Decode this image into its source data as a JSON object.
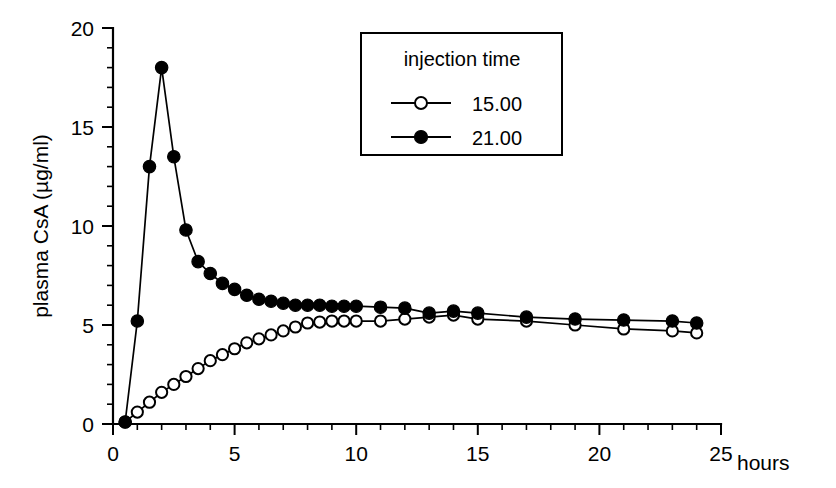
{
  "chart_data": {
    "type": "line",
    "title": "",
    "xlabel": "hours",
    "ylabel": "plasma CsA (µg/ml)",
    "xlim": [
      0,
      26.5
    ],
    "ylim": [
      0,
      20
    ],
    "x_ticks": [
      0,
      5,
      10,
      15,
      20,
      25
    ],
    "y_ticks": [
      0,
      5,
      10,
      15,
      20
    ],
    "x_minor_step": 1,
    "y_minor_step": 1,
    "grid": false,
    "legend_position": "top-right",
    "legend_title": "injection time",
    "series": [
      {
        "name": "15.00",
        "marker": "open-circle",
        "x": [
          0.5,
          1.0,
          1.5,
          2.0,
          2.5,
          3.0,
          3.5,
          4.0,
          4.5,
          5.0,
          5.5,
          6.0,
          6.5,
          7.0,
          7.5,
          8.0,
          8.5,
          9.0,
          9.5,
          10.0,
          11.0,
          12.0,
          13.0,
          14.0,
          15.0,
          17.0,
          19.0,
          21.0,
          23.0,
          24.0
        ],
        "y": [
          0.1,
          0.6,
          1.1,
          1.6,
          2.0,
          2.4,
          2.8,
          3.2,
          3.5,
          3.8,
          4.1,
          4.3,
          4.5,
          4.7,
          4.9,
          5.1,
          5.15,
          5.2,
          5.2,
          5.2,
          5.2,
          5.3,
          5.4,
          5.5,
          5.3,
          5.2,
          5.0,
          4.8,
          4.7,
          4.6
        ]
      },
      {
        "name": "21.00",
        "marker": "filled-circle",
        "x": [
          0.5,
          1.0,
          1.5,
          2.0,
          2.5,
          3.0,
          3.5,
          4.0,
          4.5,
          5.0,
          5.5,
          6.0,
          6.5,
          7.0,
          7.5,
          8.0,
          8.5,
          9.0,
          9.5,
          10.0,
          11.0,
          12.0,
          13.0,
          14.0,
          15.0,
          17.0,
          19.0,
          21.0,
          23.0,
          24.0
        ],
        "y": [
          0.1,
          5.2,
          13.0,
          18.0,
          13.5,
          9.8,
          8.2,
          7.6,
          7.1,
          6.8,
          6.5,
          6.3,
          6.2,
          6.1,
          6.0,
          6.0,
          6.0,
          5.95,
          5.95,
          5.95,
          5.9,
          5.85,
          5.6,
          5.7,
          5.6,
          5.4,
          5.3,
          5.25,
          5.2,
          5.1
        ]
      }
    ]
  },
  "axis": {
    "y_title": "plasma CsA (µg/ml)",
    "x_title": "hours",
    "y_tick_labels": [
      "0",
      "5",
      "10",
      "15",
      "20"
    ],
    "x_tick_labels": [
      "0",
      "5",
      "10",
      "15",
      "20",
      "25"
    ]
  },
  "legend": {
    "title": "injection time",
    "entries": [
      {
        "label": "15.00",
        "marker": "open-circle"
      },
      {
        "label": "21.00",
        "marker": "filled-circle"
      }
    ]
  },
  "colors": {
    "ink": "#000000",
    "background": "#ffffff",
    "marker_open_fill": "#ffffff"
  }
}
